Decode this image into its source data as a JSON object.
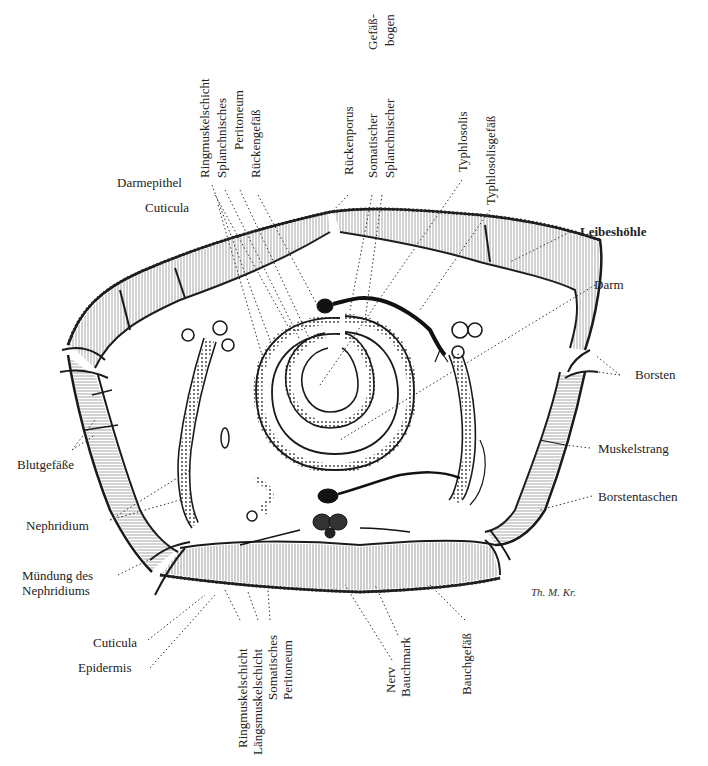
{
  "figure": {
    "signature": "Th. M. Kr.",
    "labels_top_vertical": [
      {
        "id": "ringmuskelschicht_top",
        "text": "Ringmuskelschicht"
      },
      {
        "id": "splanchnisches",
        "text": "Splanchnisches"
      },
      {
        "id": "peritoneum_top",
        "text": "Peritoneum"
      },
      {
        "id": "rueckengefaess",
        "text": "Rückengefäß"
      },
      {
        "id": "rueckenporus",
        "text": "Rückenporus"
      },
      {
        "id": "somatischer",
        "text": "Somatischer"
      },
      {
        "id": "splanchnischer",
        "text": "Splanchnischer"
      },
      {
        "id": "gefaessbogen_1",
        "text": "Gefäß-"
      },
      {
        "id": "gefaessbogen_2",
        "text": "bogen"
      },
      {
        "id": "typhlosolis",
        "text": "Typhlosolis"
      },
      {
        "id": "typhlosolisgefaess",
        "text": "Typhlosolisgefäß"
      }
    ],
    "labels_left": [
      {
        "id": "darmepithel",
        "text": "Darmepithel"
      },
      {
        "id": "cuticula_top",
        "text": "Cuticula"
      },
      {
        "id": "blutgefaesse",
        "text": "Blutgefäße"
      },
      {
        "id": "nephridium",
        "text": "Nephridium"
      },
      {
        "id": "muendung_1",
        "text": "Mündung des"
      },
      {
        "id": "muendung_2",
        "text": "Nephridiums"
      },
      {
        "id": "cuticula_bottom",
        "text": "Cuticula"
      },
      {
        "id": "epidermis",
        "text": "Epidermis"
      }
    ],
    "labels_right": [
      {
        "id": "leibeshoehle",
        "text": "Leibeshöhle"
      },
      {
        "id": "darm",
        "text": "Darm"
      },
      {
        "id": "borsten",
        "text": "Borsten"
      },
      {
        "id": "muskelstrang",
        "text": "Muskelstrang"
      },
      {
        "id": "borstentaschen",
        "text": "Borstentaschen"
      }
    ],
    "labels_bottom_vertical": [
      {
        "id": "ringmuskelschicht_bottom",
        "text": "Ringmuskelschicht"
      },
      {
        "id": "laengsmuskelschicht",
        "text": "Längsmuskelschicht"
      },
      {
        "id": "somatisches",
        "text": "Somatisches"
      },
      {
        "id": "peritoneum_bottom",
        "text": "Peritoneum"
      },
      {
        "id": "nerv",
        "text": "Nerv"
      },
      {
        "id": "bauchmark",
        "text": "Bauchmark"
      },
      {
        "id": "bauchgefaess",
        "text": "Bauchgefäß"
      }
    ],
    "colors": {
      "ink": "#1a1a1a",
      "paper": "#ffffff",
      "hatch": "#555555"
    }
  }
}
